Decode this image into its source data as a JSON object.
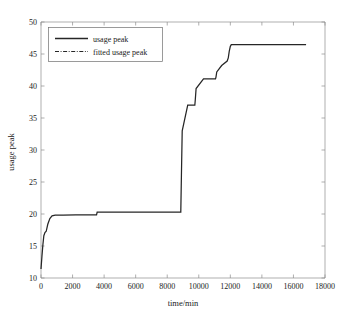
{
  "chart_data": {
    "type": "line",
    "title": "",
    "xlabel": "time/min",
    "ylabel": "usage peak",
    "xlim": [
      0,
      18000
    ],
    "ylim": [
      10,
      50
    ],
    "xticks": [
      0,
      2000,
      4000,
      6000,
      8000,
      10000,
      12000,
      14000,
      16000,
      18000
    ],
    "xtick_labels": [
      "0",
      "2000",
      "4000",
      "6000",
      "8000",
      "10000",
      "12000",
      "14000",
      "16000",
      "18000"
    ],
    "yticks": [
      10,
      15,
      20,
      25,
      30,
      35,
      40,
      45,
      50
    ],
    "ytick_labels": [
      "10",
      "15",
      "20",
      "25",
      "30",
      "35",
      "40",
      "45",
      "50"
    ],
    "grid": false,
    "legend_position": "upper-left",
    "series": [
      {
        "name": "usage peak",
        "style": "solid",
        "color": "#262626",
        "x": [
          0,
          60,
          120,
          180,
          250,
          330,
          430,
          560,
          700,
          900,
          1400,
          2200,
          3000,
          3520,
          3560,
          4600,
          6000,
          7400,
          8400,
          8860,
          8900,
          8950,
          9300,
          9750,
          9780,
          9830,
          10300,
          10800,
          11060,
          11090,
          11140,
          11450,
          11800,
          11870,
          11930,
          12000,
          12060,
          13000,
          14500,
          16000,
          16800
        ],
        "y": [
          11.4,
          13.4,
          15.2,
          16.6,
          17.1,
          17.3,
          18.4,
          19.3,
          19.7,
          19.82,
          19.84,
          19.85,
          19.85,
          19.86,
          20.3,
          20.3,
          20.3,
          20.3,
          20.3,
          20.31,
          26.0,
          33.0,
          37.0,
          37.0,
          37.9,
          39.6,
          41.1,
          41.1,
          41.12,
          41.4,
          42.2,
          43.2,
          43.9,
          44.4,
          45.4,
          46.2,
          46.45,
          46.45,
          46.45,
          46.45,
          46.45
        ]
      },
      {
        "name": "fitted usage peak",
        "style": "dashdot",
        "color": "#262626",
        "x": [],
        "y": []
      }
    ],
    "legend_entries": [
      {
        "label": "usage peak",
        "style": "solid"
      },
      {
        "label": "fitted usage peak",
        "style": "dashdot"
      }
    ]
  },
  "axes": {
    "x_axis_label": "time/min",
    "y_axis_label": "usage peak"
  },
  "colors": {
    "line": "#262626",
    "frame": "#8d8d8d",
    "background": "#ffffff",
    "text": "#1a1a1a"
  }
}
